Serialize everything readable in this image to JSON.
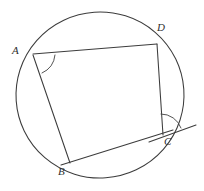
{
  "figure": {
    "background_color": "#ffffff",
    "stroke_color": "#3c3c3c",
    "label_color": "#2f2f2f"
  },
  "circle": {
    "name": "circumscribed-circle",
    "center_x": 100,
    "center_y": 95,
    "radius": 84
  },
  "points": {
    "A": {
      "label": "A",
      "x": 33,
      "y": 54,
      "label_x": 12,
      "label_y": 45
    },
    "B": {
      "label": "B",
      "x": 68,
      "y": 162,
      "label_x": 58,
      "label_y": 166
    },
    "C": {
      "label": "C",
      "x": 163,
      "y": 135,
      "label_x": 164,
      "label_y": 136
    },
    "D": {
      "label": "D",
      "x": 157,
      "y": 44,
      "label_x": 157,
      "label_y": 22
    }
  },
  "segments": [
    {
      "name": "segment-AD",
      "from": "A",
      "to": "D",
      "x1": 33,
      "y1": 54,
      "x2": 157,
      "y2": 44
    },
    {
      "name": "segment-DC",
      "from": "D",
      "to": "C",
      "x1": 157,
      "y1": 44,
      "x2": 163,
      "y2": 135
    },
    {
      "name": "segment-AB",
      "from": "A",
      "to": "B",
      "x1": 33,
      "y1": 55,
      "x2": 70,
      "y2": 163
    },
    {
      "name": "segment-BC",
      "from": "B",
      "to": "C",
      "x1": 62,
      "y1": 165,
      "x2": 172,
      "y2": 130
    }
  ],
  "tangent_line": {
    "name": "tangent-at-C",
    "x1": 148,
    "y1": 142,
    "x2": 196,
    "y2": 125
  },
  "angle_marks": [
    {
      "name": "angle-mark-A",
      "at": "A",
      "note": "arc marking interior angle DAB at vertex A"
    },
    {
      "name": "angle-mark-C",
      "at": "C",
      "note": "arc marking angle between chord DC and tangent at C"
    }
  ]
}
